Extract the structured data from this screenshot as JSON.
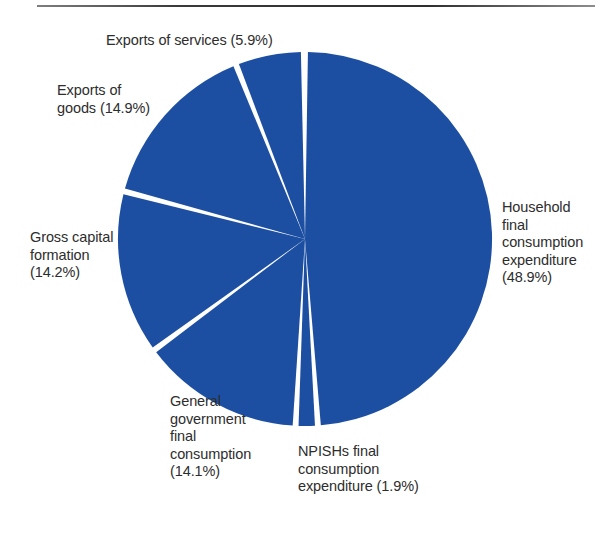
{
  "page": {
    "background_color": "#ffffff",
    "rule_color": "#333333"
  },
  "chart_data": {
    "type": "pie",
    "title": "",
    "subtitle": "",
    "xlabel": "",
    "ylabel": "",
    "legend_position": "labels-around-pie",
    "grid": false,
    "start_angle_deg": 0,
    "direction": "clockwise",
    "slice_color": "#1c4fa1",
    "separator_color": "#ffffff",
    "categories": [
      "Household final consumption expenditure",
      "NPISHs final consumption expenditure",
      "General government final consumption",
      "Gross capital formation",
      "Exports of goods",
      "Exports of services"
    ],
    "values": [
      48.9,
      1.9,
      14.1,
      14.2,
      14.9,
      5.9
    ],
    "unit": "%",
    "slices": [
      {
        "name": "household",
        "label": "Household\nfinal\nconsumption\nexpenditure\n(48.9%)",
        "value": 48.9,
        "start_pct": 0,
        "end_pct": 48.9
      },
      {
        "name": "npishs",
        "label": "NPISHs final\nconsumption\nexpenditure (1.9%)",
        "value": 1.9,
        "start_pct": 48.9,
        "end_pct": 50.8
      },
      {
        "name": "general-government",
        "label": "General\ngovernment\nfinal\nconsumption\n(14.1%)",
        "value": 14.1,
        "start_pct": 50.8,
        "end_pct": 64.9
      },
      {
        "name": "gross-capital-formation",
        "label": "Gross capital\nformation\n(14.2%)",
        "value": 14.2,
        "start_pct": 64.9,
        "end_pct": 79.1
      },
      {
        "name": "exports-of-goods",
        "label": "Exports of\ngoods (14.9%)",
        "value": 14.9,
        "start_pct": 79.1,
        "end_pct": 94.0
      },
      {
        "name": "exports-of-services",
        "label": "Exports of services (5.9%)",
        "value": 5.9,
        "start_pct": 94.0,
        "end_pct": 99.9
      }
    ]
  },
  "labels": {
    "exports_services": "Exports of services (5.9%)",
    "exports_goods": "Exports of\ngoods (14.9%)",
    "gross_capital": "Gross capital\nformation\n(14.2%)",
    "general_government": "General\ngovernment\nfinal\nconsumption\n(14.1%)",
    "npishs": "NPISHs final\nconsumption\nexpenditure (1.9%)",
    "household": "Household\nfinal\nconsumption\nexpenditure\n(48.9%)"
  }
}
